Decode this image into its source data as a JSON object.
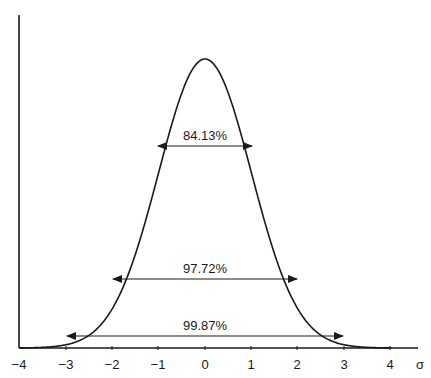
{
  "chart_data": {
    "type": "line",
    "title": "",
    "xlabel": "σ",
    "ylabel": "",
    "xlim": [
      -4,
      4
    ],
    "x_ticks": [
      "−4",
      "−3",
      "−2",
      "−1",
      "0",
      "1",
      "2",
      "3",
      "4"
    ],
    "grid": false,
    "legend": null,
    "series": [
      {
        "name": "Normal distribution curve",
        "function": "standard normal density",
        "mean": 0,
        "sd": 1
      }
    ],
    "annotations": [
      {
        "label": "84.13%",
        "from": -1,
        "to": 1
      },
      {
        "label": "97.72%",
        "from": -2,
        "to": 2
      },
      {
        "label": "99.87%",
        "from": -3,
        "to": 3
      }
    ]
  },
  "axis": {
    "x_unit": "σ",
    "ticks": [
      "−4",
      "−3",
      "−2",
      "−1",
      "0",
      "1",
      "2",
      "3",
      "4"
    ]
  },
  "annotations": {
    "a1": "84.13%",
    "a2": "97.72%",
    "a3": "99.87%"
  },
  "colors": {
    "line": "#1a1a1a",
    "background": "#ffffff"
  }
}
